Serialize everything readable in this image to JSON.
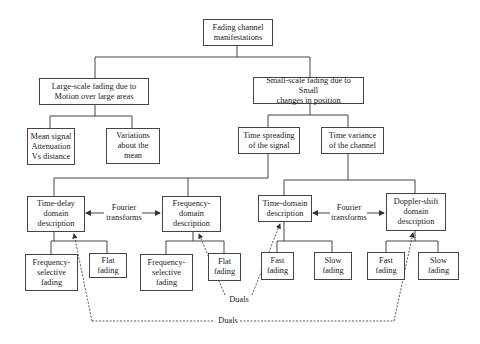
{
  "title": "Fading channel manifestations",
  "nodes": {
    "root": "Fading channel\nmanifestations",
    "large_scale": "Large-scale fading due to\nMotion over large areas",
    "small_scale": "Small-scale fading due to Small\nchanges in position",
    "mean_signal": "Mean signal\nAttenuation\nVs distance",
    "variations": "Variations\nabout the\nmean",
    "time_spreading": "Time spreading\nof the signal",
    "time_variance": "Time variance\nof the channel",
    "time_delay": "Time-delay\ndomain\ndescription",
    "frequency_domain": "Frequency-\ndomain\ndescription",
    "time_domain": "Time-domain\ndescription",
    "doppler_shift": "Doppler-shift\ndomain\ndescription",
    "freq_selective_1": "Frequency-\nselective\nfading",
    "flat_fading_1": "Flat\nfading",
    "freq_selective_2": "Frequency-\nselective\nfading",
    "flat_fading_2": "Flat\nfading",
    "fast_fading_1": "Fast\nfading",
    "slow_fading_1": "Slow\nfading",
    "fast_fading_2": "Fast\nfading",
    "slow_fading_2": "Slow\nfading"
  },
  "annotations": {
    "fourier_left": "Fourier\ntransforms",
    "fourier_right": "Fourier\ntransforms",
    "duals_inner": "Duals",
    "duals_outer": "Duals"
  },
  "colors": {
    "line": "#444444",
    "background": "#ffffff",
    "text": "#222222"
  }
}
